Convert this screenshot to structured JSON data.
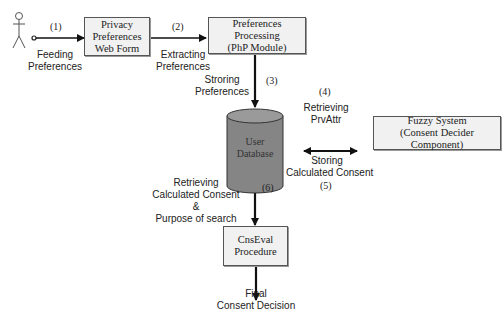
{
  "diagram": {
    "actor": {
      "icon": "stick-figure-user-icon"
    },
    "nodes": {
      "web_form": {
        "lines": [
          "Privacy",
          "Preferences",
          "Web Form"
        ]
      },
      "php_module": {
        "lines": [
          "Preferences Processing",
          "(PhP Module)"
        ]
      },
      "database": {
        "lines": [
          "User",
          "Database"
        ],
        "color": "#808080"
      },
      "fuzzy": {
        "lines": [
          "Fuzzy System",
          "(Consent Decider Component)"
        ]
      },
      "cnseval": {
        "lines": [
          "CnsEval",
          "Procedure"
        ]
      }
    },
    "edges": {
      "e1": {
        "step": "(1)",
        "lines": [
          "Feeding",
          "Preferences"
        ]
      },
      "e2": {
        "step": "(2)",
        "lines": [
          "Extracting",
          "Preferences"
        ]
      },
      "e3": {
        "step": "(3)",
        "lines": [
          "Stroring",
          "Preferences"
        ]
      },
      "e4": {
        "step": "(4)",
        "lines": [
          "Retrieving",
          "PrvAttr"
        ]
      },
      "e5": {
        "step": "(5)",
        "lines": [
          "Storing",
          "Calculated Consent"
        ]
      },
      "e6": {
        "step": "(6)",
        "lines": [
          "Retrieving",
          "Calculated Consent",
          "&",
          "Purpose of search"
        ]
      },
      "output": {
        "lines": [
          "Final",
          "Consent Decision"
        ]
      }
    }
  }
}
